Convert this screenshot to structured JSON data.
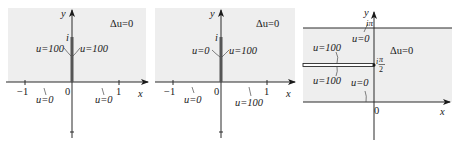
{
  "colors": {
    "shade": "#eeeeee",
    "axis": "#2a2a2a",
    "slit": "#555555",
    "text": "#1a1a1a"
  },
  "panels": [
    {
      "id": "panel-1",
      "equation": "Δu=0",
      "y_axis_label": "y",
      "x_axis_label": "x",
      "origin_label": "0",
      "tick_labels": [
        "−1",
        "1"
      ],
      "slit_top_label": "i",
      "boundary_labels": {
        "slit_left": "u=100",
        "slit_right": "u=100",
        "axis_left": "u=0",
        "axis_right": "u=0"
      }
    },
    {
      "id": "panel-2",
      "equation": "Δu=0",
      "y_axis_label": "y",
      "x_axis_label": "x",
      "origin_label": "0",
      "tick_labels": [
        "−1",
        "1"
      ],
      "slit_top_label": "i",
      "boundary_labels": {
        "slit_left": "u=0",
        "slit_right": "u=100",
        "axis_left": "u=0",
        "axis_right": "u=100"
      }
    },
    {
      "id": "panel-3",
      "equation": "Δu=0",
      "y_axis_label": "y",
      "x_axis_label": "x",
      "origin_label": "0",
      "top_label": "iπ",
      "mid_label_num": "π",
      "mid_label_den": "2",
      "mid_label_prefix": "i",
      "boundary_labels": {
        "top_line": "u=0",
        "slit_upper": "u=100",
        "slit_lower": "u=100",
        "bottom_line": "u=0"
      }
    }
  ]
}
